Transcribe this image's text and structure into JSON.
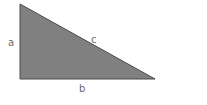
{
  "diagram": {
    "type": "right-triangle",
    "fill_color": "#808080",
    "stroke_color": "#4a4a4a",
    "label_color": "#6b6b6b",
    "labels": {
      "a": "a",
      "b": "b",
      "c": "c"
    }
  }
}
